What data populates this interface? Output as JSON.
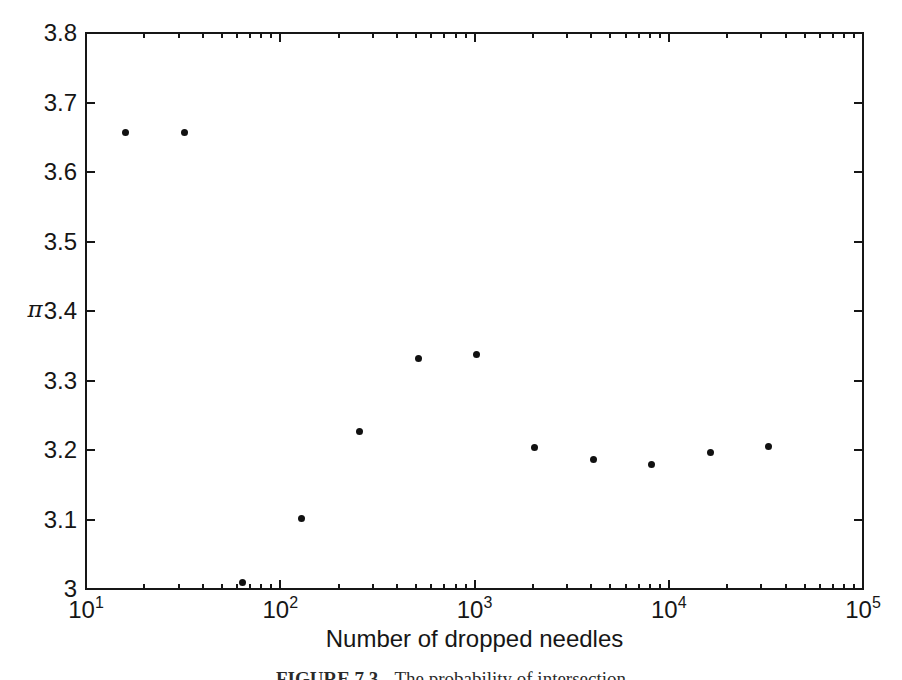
{
  "figure": {
    "caption_prefix": "FIGURE 7.3",
    "caption_text": "The probability of intersection"
  },
  "chart_data": {
    "type": "scatter",
    "title": "",
    "xlabel": "Number of dropped needles",
    "ylabel": "π",
    "x_scale": "log10",
    "y_scale": "linear",
    "xlim": [
      10,
      100000
    ],
    "ylim": [
      3.0,
      3.8
    ],
    "grid": false,
    "legend": null,
    "marker": {
      "shape": "filled-circle",
      "color": "#111111",
      "size_px": 7
    },
    "ink_color": "#161616",
    "background": "#ffffff",
    "x_ticks": [
      {
        "value": 10,
        "label_base": "10",
        "label_exp": "1"
      },
      {
        "value": 100,
        "label_base": "10",
        "label_exp": "2"
      },
      {
        "value": 1000,
        "label_base": "10",
        "label_exp": "3"
      },
      {
        "value": 10000,
        "label_base": "10",
        "label_exp": "4"
      },
      {
        "value": 100000,
        "label_base": "10",
        "label_exp": "5"
      }
    ],
    "x_minor_ticks_per_decade": [
      2,
      3,
      4,
      5,
      6,
      7,
      8,
      9
    ],
    "y_ticks": [
      {
        "value": 3.0,
        "label": "3"
      },
      {
        "value": 3.1,
        "label": "3.1"
      },
      {
        "value": 3.2,
        "label": "3.2"
      },
      {
        "value": 3.3,
        "label": "3.3"
      },
      {
        "value": 3.4,
        "label": "3.4"
      },
      {
        "value": 3.5,
        "label": "3.5"
      },
      {
        "value": 3.6,
        "label": "3.6"
      },
      {
        "value": 3.7,
        "label": "3.7"
      },
      {
        "value": 3.8,
        "label": "3.8"
      }
    ],
    "points": [
      {
        "x": 16,
        "y": 3.657
      },
      {
        "x": 32,
        "y": 3.657
      },
      {
        "x": 64,
        "y": 3.01
      },
      {
        "x": 128,
        "y": 3.102
      },
      {
        "x": 256,
        "y": 3.226
      },
      {
        "x": 512,
        "y": 3.331
      },
      {
        "x": 1024,
        "y": 3.338
      },
      {
        "x": 2048,
        "y": 3.204
      },
      {
        "x": 4096,
        "y": 3.187
      },
      {
        "x": 8192,
        "y": 3.179
      },
      {
        "x": 16384,
        "y": 3.197
      },
      {
        "x": 32768,
        "y": 3.205
      }
    ]
  }
}
